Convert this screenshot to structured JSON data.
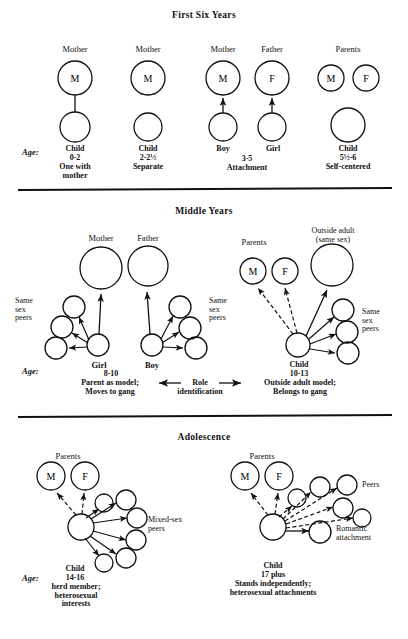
{
  "figure": {
    "title_note": "Developmental stages of attachment and peer relations",
    "ink_color": "#111111",
    "bg_color": "#ffffff"
  },
  "sections": [
    {
      "id": "first-six-years",
      "title": "First Six Years"
    },
    {
      "id": "middle-years",
      "title": "Middle Years"
    },
    {
      "id": "adolescence",
      "title": "Adolescence"
    }
  ],
  "age_label": "Age:",
  "panel1": {
    "groups": [
      {
        "id": "g1",
        "top_label": "Mother",
        "parent_letters": [
          "M"
        ],
        "child_label": "Child",
        "age": "0-2",
        "desc": "One with\nmother",
        "link": "line"
      },
      {
        "id": "g2",
        "top_label": "Mother",
        "parent_letters": [
          "M"
        ],
        "child_label": "Child",
        "age": "2-2½",
        "desc": "Separate",
        "link": "none"
      },
      {
        "id": "g3",
        "top_label": "Mother",
        "parent_letters": [
          "M"
        ],
        "child_label": "Boy",
        "age": "3-5",
        "desc": "Attachment",
        "link": "arrow-up"
      },
      {
        "id": "g4",
        "top_label": "Father",
        "parent_letters": [
          "F"
        ],
        "child_label": "Girl",
        "age": "3-5",
        "desc": "Attachment",
        "link": "arrow-up"
      },
      {
        "id": "g5",
        "top_label": "Parents",
        "parent_letters": [
          "M",
          "F"
        ],
        "child_label": "Child",
        "age": "5½-6",
        "desc": "Self-centered",
        "link": "none"
      }
    ],
    "shared_age_3_5": "3-5",
    "shared_desc_3_5": "Attachment"
  },
  "panel2": {
    "left": {
      "parent_labels": [
        "Mother",
        "Father"
      ],
      "peers_label_left": "Same\nsex\npeers",
      "peers_label_right": "Same\nsex\npeers",
      "child_labels": [
        "Girl",
        "Boy"
      ],
      "age": "8-10",
      "desc": "Parent as model;\nMoves to gang"
    },
    "center": {
      "role_label": "Role\nidentification"
    },
    "right": {
      "parents_label": "Parents",
      "parent_letters": [
        "M",
        "F"
      ],
      "outside_adult_label": "Outside adult\n(same sex)",
      "peers_label": "Same\nsex\npeers",
      "child_label": "Child",
      "age": "10-13",
      "desc": "Outside adult model;\nBelongs to gang"
    }
  },
  "panel3": {
    "left": {
      "parents_label": "Parents",
      "parent_letters": [
        "M",
        "F"
      ],
      "peers_label": "Mixed-sex\npeers",
      "child_label": "Child",
      "age": "14-16",
      "desc": "herd member;\nheterosexual\ninterests"
    },
    "right": {
      "parents_label": "Parents",
      "parent_letters": [
        "M",
        "F"
      ],
      "peers_label": "Peers",
      "romantic_label": "Romantic\nattachment",
      "child_label": "Child",
      "age": "17 plus",
      "desc": "Stands independently;\nheterosexual attachments"
    }
  }
}
